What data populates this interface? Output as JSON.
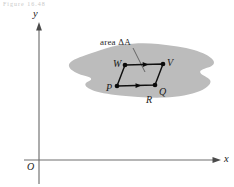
{
  "figure": {
    "caption_fragment": "Figure 16.48",
    "axes": {
      "x_label": "x",
      "y_label": "y",
      "origin_label": "O"
    },
    "region": {
      "name_label": "R",
      "fill_color": "#bcbcbc"
    },
    "patch": {
      "area_label": "area ΔA",
      "vertices": [
        {
          "id": "P",
          "label": "P",
          "x": 117,
          "y": 86
        },
        {
          "id": "Q",
          "label": "Q",
          "x": 155,
          "y": 85
        },
        {
          "id": "V",
          "label": "V",
          "x": 163,
          "y": 64
        },
        {
          "id": "W",
          "label": "W",
          "x": 125,
          "y": 65
        }
      ],
      "edge_color": "#101010"
    }
  }
}
